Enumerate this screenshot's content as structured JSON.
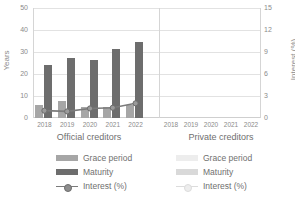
{
  "chart_data": {
    "type": "bar",
    "title": "",
    "ylabel": "Years",
    "ylabel_secondary": "Interest (%)",
    "xlabel": "",
    "ylim": [
      0,
      50
    ],
    "ylim_secondary": [
      0,
      15
    ],
    "yticks": [
      "0",
      "10",
      "20",
      "30",
      "40",
      "50"
    ],
    "yticks_secondary": [
      "0",
      "3",
      "6",
      "9",
      "12",
      "15"
    ],
    "grid": true,
    "legend_position": "bottom",
    "panels": [
      {
        "name": "Official creditors",
        "categories": [
          "2018",
          "2019",
          "2020",
          "2021",
          "2022"
        ],
        "series": [
          {
            "name": "Grace period",
            "axis": "left",
            "values": [
              5.7,
              7.6,
              5.2,
              4.8,
              6.0
            ]
          },
          {
            "name": "Maturity",
            "axis": "left",
            "values": [
              24.2,
              27.1,
              26.3,
              31.3,
              34.6
            ]
          },
          {
            "name": "Interest (%)",
            "axis": "right",
            "values": [
              1.0,
              0.9,
              1.3,
              1.4,
              2.0
            ]
          }
        ]
      },
      {
        "name": "Private creditors",
        "categories": [
          "2018",
          "2019",
          "2020",
          "2021",
          "2022"
        ],
        "series": [
          {
            "name": "Grace period",
            "axis": "left",
            "values": []
          },
          {
            "name": "Maturity",
            "axis": "left",
            "values": []
          },
          {
            "name": "Interest (%)",
            "axis": "right",
            "values": []
          }
        ]
      }
    ]
  },
  "legend": {
    "left": {
      "grace": "Grace period",
      "maturity": "Maturity",
      "interest": "Interest (%)"
    },
    "right": {
      "grace": "Grace period",
      "maturity": "Maturity",
      "interest": "Interest (%)"
    }
  },
  "colors": {
    "grace": "#a6a6a6",
    "maturity": "#6d6d6d",
    "interest_line": "#7b7b7b",
    "grace_faint": "#ededed",
    "maturity_faint": "#d9d9d9",
    "grid": "#e2e2e2",
    "text": "#8b8b8b"
  }
}
